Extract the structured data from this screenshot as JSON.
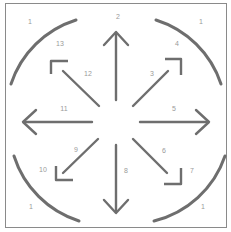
{
  "diagram": {
    "type": "directional-movement-diagram",
    "stroke_color": "#6e6e6e",
    "label_color": "#9a9a9a",
    "border_color": "#8a8a8a",
    "labels": [
      {
        "id": "corner-tl",
        "text": "1",
        "x": 30,
        "y": 21
      },
      {
        "id": "corner-tr",
        "text": "1",
        "x": 201,
        "y": 21
      },
      {
        "id": "corner-bl",
        "text": "1",
        "x": 31,
        "y": 206
      },
      {
        "id": "corner-br",
        "text": "1",
        "x": 203,
        "y": 206
      },
      {
        "id": "up",
        "text": "2",
        "x": 118,
        "y": 16
      },
      {
        "id": "up-right-diag",
        "text": "3",
        "x": 152,
        "y": 73
      },
      {
        "id": "up-right-corner",
        "text": "4",
        "x": 177,
        "y": 43
      },
      {
        "id": "right",
        "text": "5",
        "x": 174,
        "y": 108
      },
      {
        "id": "down-right-diag",
        "text": "6",
        "x": 164,
        "y": 150
      },
      {
        "id": "down-right-corner",
        "text": "7",
        "x": 192,
        "y": 170
      },
      {
        "id": "down",
        "text": "8",
        "x": 126,
        "y": 170
      },
      {
        "id": "down-left-diag",
        "text": "9",
        "x": 76,
        "y": 149
      },
      {
        "id": "down-left-corner",
        "text": "10",
        "x": 43,
        "y": 169
      },
      {
        "id": "left",
        "text": "11",
        "x": 64,
        "y": 108
      },
      {
        "id": "up-left-diag",
        "text": "12",
        "x": 88,
        "y": 73
      },
      {
        "id": "up-left-corner",
        "text": "13",
        "x": 60,
        "y": 43
      }
    ]
  }
}
